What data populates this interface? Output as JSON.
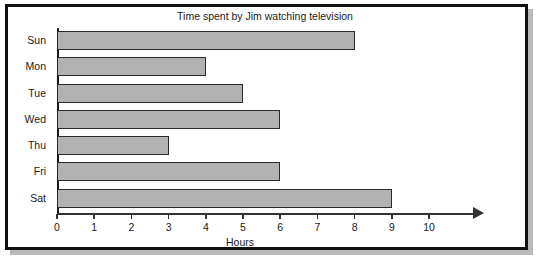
{
  "chart_data": {
    "type": "bar",
    "orientation": "horizontal",
    "title": "Time spent by Jim watching television",
    "xlabel": "Hours",
    "ylabel": "",
    "categories": [
      "Sun",
      "Mon",
      "Tue",
      "Wed",
      "Thu",
      "Fri",
      "Sat"
    ],
    "values": [
      8,
      4,
      5,
      6,
      3,
      6,
      9
    ],
    "xticks": [
      0,
      1,
      2,
      3,
      4,
      5,
      6,
      7,
      8,
      9,
      10
    ],
    "xlim": [
      0,
      11.3
    ],
    "grid": false,
    "legend": null,
    "bar_color": "#b2b2b2",
    "bar_edge_color": "#2a2a2a",
    "axis_color": "#333333",
    "text_color": "#1a1a1a",
    "background": "#ffffff",
    "frame_color": "#111111",
    "x_axis_has_arrow": true
  }
}
